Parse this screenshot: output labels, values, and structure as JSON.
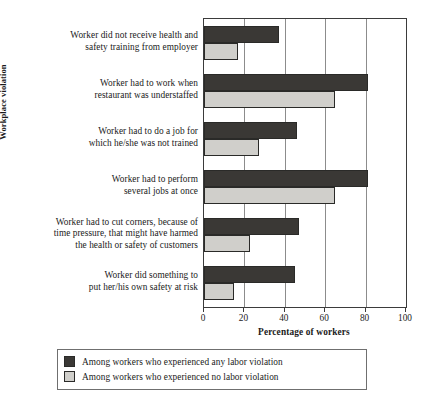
{
  "chart_data": {
    "type": "bar",
    "orientation": "horizontal",
    "title": "",
    "xlabel": "Percentage of workers",
    "ylabel": "Workplace violation",
    "xlim": [
      0,
      100
    ],
    "xticks": [
      0,
      20,
      40,
      60,
      80,
      100
    ],
    "grid": true,
    "grid_axis": "x",
    "legend_position": "bottom",
    "categories": [
      "Worker did not receive health and safety training from employer",
      "Worker had to work when restaurant was understaffed",
      "Worker had to do a job for which he/she was not trained",
      "Worker had to perform several jobs at once",
      "Worker had to cut corners, because of time pressure, that might have harmed the health or safety of customers",
      "Worker did something to put her/his own safety at risk"
    ],
    "category_lines": [
      [
        "Worker did not receive health and",
        "safety training from employer"
      ],
      [
        "Worker had to work when",
        "restaurant was understaffed"
      ],
      [
        "Worker had to do a job for",
        "which he/she was not trained"
      ],
      [
        "Worker had to perform",
        "several jobs at once"
      ],
      [
        "Worker had to cut corners, because of",
        "time pressure, that might have harmed",
        "the health or safety of customers"
      ],
      [
        "Worker did something to",
        "put her/his own safety at risk"
      ]
    ],
    "series": [
      {
        "name": "Among workers who experienced any labor violation",
        "color": "#3a3835",
        "values": [
          37,
          81,
          46,
          81,
          47,
          45
        ]
      },
      {
        "name": "Among workers who experienced no labor violation",
        "color": "#d0cfcb",
        "values": [
          17,
          65,
          27,
          65,
          23,
          15
        ]
      }
    ]
  },
  "axis": {
    "x_title": "Percentage of workers",
    "y_title": "Workplace violation",
    "tick_labels": [
      "0",
      "20",
      "40",
      "60",
      "80",
      "100"
    ]
  },
  "legend": {
    "items": [
      {
        "label": "Among workers who experienced any labor violation",
        "key": "any"
      },
      {
        "label": "Among workers who experienced no labor violation",
        "key": "none"
      }
    ]
  },
  "colors": {
    "series_any": "#3a3835",
    "series_none": "#d0cfcb",
    "frame": "#3b3b3b",
    "gridline": "#8c8c8c"
  }
}
